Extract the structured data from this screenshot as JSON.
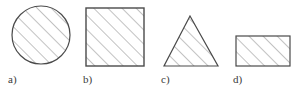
{
  "figure": {
    "background_color": "#ffffff",
    "stroke_color": "#4a4a4a",
    "hatch_color": "#8f8f8f",
    "label_color": "#3a3a3a",
    "hatch_angle_degrees": 45,
    "hatch_spacing_px": 10,
    "shapes": [
      {
        "id": "circle",
        "icon": "hatched-circle-shape",
        "type": "circle",
        "label": "a)",
        "label_x": 8,
        "label_y": 73,
        "cx": 41,
        "cy": 35,
        "r": 29
      },
      {
        "id": "square",
        "icon": "hatched-square-shape",
        "type": "square",
        "label": "b)",
        "label_x": 83,
        "label_y": 73,
        "x": 86,
        "y": 8,
        "width": 58,
        "height": 58
      },
      {
        "id": "triangle",
        "icon": "hatched-triangle-shape",
        "type": "triangle",
        "label": "c)",
        "label_x": 161,
        "label_y": 73,
        "points": "190,16 218,66 164,66"
      },
      {
        "id": "rectangle",
        "icon": "hatched-rectangle-shape",
        "type": "rectangle",
        "label": "d)",
        "label_x": 233,
        "label_y": 73,
        "x": 236,
        "y": 36,
        "width": 54,
        "height": 30
      }
    ]
  }
}
